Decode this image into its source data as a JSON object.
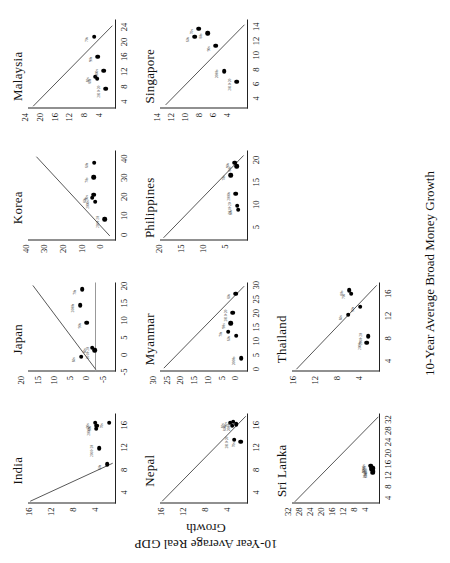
{
  "figure": {
    "xlabel": "10-Year Average Broad Money Growth",
    "ylabel": "10-Year Average Real GDP Growth"
  },
  "chart_data": {
    "type": "scatter",
    "title": "",
    "xlabel": "10-Year Average Broad Money Growth",
    "ylabel": "10-Year Average Real GDP Growth",
    "grid": false,
    "legend": "none",
    "point_labels": [
      "60s",
      "70s",
      "80s",
      "90s",
      "2000s",
      "2010-20"
    ],
    "panels": [
      {
        "name": "India",
        "xlim": [
          2,
          18
        ],
        "ylim": [
          2,
          18
        ],
        "xticks": [
          4,
          8,
          12,
          16
        ],
        "yticks": [
          4,
          8,
          12,
          16
        ],
        "trend": {
          "x1": 2.4,
          "y1": 17.6,
          "x2": 9.2,
          "y2": 2.6
        },
        "points": [
          {
            "label": "60s",
            "x": 9.0,
            "y": 3.6
          },
          {
            "label": "70s",
            "x": 16.4,
            "y": 3.2
          },
          {
            "label": "80s",
            "x": 15.9,
            "y": 5.5
          },
          {
            "label": "90s",
            "x": 16.4,
            "y": 5.8
          },
          {
            "label": "2000s",
            "x": 15.4,
            "y": 5.6
          },
          {
            "label": "2010-20",
            "x": 11.9,
            "y": 5.1
          }
        ]
      },
      {
        "name": "Japan",
        "xlim": [
          -5,
          21
        ],
        "ylim": [
          -6,
          21
        ],
        "xticks": [
          -5,
          0,
          5,
          10,
          15,
          20
        ],
        "yticks": [
          -5,
          0,
          5,
          10,
          15,
          20
        ],
        "zeroline_y": 0,
        "trend": {
          "x1": -4.4,
          "y1": 0.2,
          "x2": 20.0,
          "y2": 19.5
        },
        "points": [
          {
            "label": "60s",
            "x": -0.6,
            "y": 4.6
          },
          {
            "label": "70s",
            "x": 19.0,
            "y": 4.3
          },
          {
            "label": "80s",
            "x": 2.0,
            "y": 1.4
          },
          {
            "label": "90s",
            "x": 9.3,
            "y": 3.0
          },
          {
            "label": "2000s",
            "x": 14.4,
            "y": 5.0
          },
          {
            "label": "2010-20",
            "x": 1.3,
            "y": 0.6
          }
        ]
      },
      {
        "name": "Korea",
        "xlim": [
          -3,
          44
        ],
        "ylim": [
          -3,
          44
        ],
        "xticks": [
          0,
          10,
          20,
          30,
          40
        ],
        "yticks": [
          0,
          10,
          20,
          30,
          40
        ],
        "trend": {
          "x1": -0.6,
          "y1": 0.3,
          "x2": 41.0,
          "y2": 39.5
        },
        "points": [
          {
            "label": "60s",
            "x": 38.0,
            "y": 8.7
          },
          {
            "label": "70s",
            "x": 30.2,
            "y": 8.9
          },
          {
            "label": "80s",
            "x": 19.5,
            "y": 9.6
          },
          {
            "label": "90s",
            "x": 21.0,
            "y": 9.0
          },
          {
            "label": "2000s",
            "x": 17.4,
            "y": 8.0
          },
          {
            "label": "2010-20",
            "x": 8.2,
            "y": 3.1
          }
        ]
      },
      {
        "name": "Malaysia",
        "xlim": [
          2,
          26
        ],
        "ylim": [
          2,
          26
        ],
        "xticks": [
          4,
          8,
          12,
          16,
          20,
          24
        ],
        "yticks": [
          4,
          8,
          12,
          16,
          20,
          24
        ],
        "trend": {
          "x1": 2.6,
          "y1": 24.6,
          "x2": 24.2,
          "y2": 3.0
        },
        "points": [
          {
            "label": "60s",
            "x": 10.6,
            "y": 7.6
          },
          {
            "label": "70s",
            "x": 21.4,
            "y": 7.9
          },
          {
            "label": "80s",
            "x": 10.2,
            "y": 7.2
          },
          {
            "label": "90s",
            "x": 16.1,
            "y": 7.0
          },
          {
            "label": "2000s",
            "x": 12.3,
            "y": 5.4
          },
          {
            "label": "2010-20",
            "x": 7.4,
            "y": 4.8
          }
        ]
      },
      {
        "name": "Nepal",
        "xlim": [
          2,
          18
        ],
        "ylim": [
          2,
          18
        ],
        "xticks": [
          4,
          8,
          12,
          16
        ],
        "yticks": [
          4,
          8,
          12,
          16
        ],
        "trend": {
          "x1": 2.4,
          "y1": 17.6,
          "x2": 17.6,
          "y2": 2.4
        },
        "points": [
          {
            "label": "60s",
            "x": 16.4,
            "y": 5.2
          },
          {
            "label": "70s",
            "x": 13.0,
            "y": 3.3
          },
          {
            "label": "80s",
            "x": 15.9,
            "y": 4.9
          },
          {
            "label": "90s",
            "x": 16.6,
            "y": 4.7
          },
          {
            "label": "2000s",
            "x": 16.2,
            "y": 4.2
          },
          {
            "label": "2010-20",
            "x": 13.4,
            "y": 4.5
          }
        ]
      },
      {
        "name": "Myanmar",
        "xlim": [
          -1,
          31
        ],
        "ylim": [
          -1,
          31
        ],
        "xticks": [
          0,
          5,
          10,
          15,
          20,
          25,
          30
        ],
        "yticks": [
          0,
          5,
          10,
          15,
          20,
          25,
          30
        ],
        "trend": {
          "x1": 0.2,
          "y1": 29.6,
          "x2": 29.5,
          "y2": 0.4
        },
        "points": [
          {
            "label": "60s",
            "x": 12.0,
            "y": 3.2
          },
          {
            "label": "70s",
            "x": 13.5,
            "y": 6.2
          },
          {
            "label": "80s",
            "x": 27.0,
            "y": 3.5
          },
          {
            "label": "90s",
            "x": 16.5,
            "y": 5.3
          },
          {
            "label": "2000s",
            "x": 4.0,
            "y": 1.4
          },
          {
            "label": "2010-20",
            "x": 20.2,
            "y": 4.6
          }
        ]
      },
      {
        "name": "Philippines",
        "xlim": [
          2,
          22
        ],
        "ylim": [
          2,
          22
        ],
        "xticks": [
          5,
          10,
          15,
          20
        ],
        "yticks": [
          5,
          10,
          15,
          20
        ],
        "trend": {
          "x1": 2.6,
          "y1": 21.2,
          "x2": 21.0,
          "y2": 3.0
        },
        "points": [
          {
            "label": "60s",
            "x": 8.9,
            "y": 4.2
          },
          {
            "label": "70s",
            "x": 16.6,
            "y": 5.9
          },
          {
            "label": "80s",
            "x": 18.6,
            "y": 4.6
          },
          {
            "label": "90s",
            "x": 19.4,
            "y": 5.0
          },
          {
            "label": "2000s",
            "x": 12.5,
            "y": 4.8
          },
          {
            "label": "2010-20",
            "x": 9.8,
            "y": 4.4
          }
        ]
      },
      {
        "name": "Singapore",
        "xlim": [
          2.5,
          15
        ],
        "ylim": [
          2.5,
          15
        ],
        "xticks": [
          4,
          6,
          8,
          10,
          12,
          14
        ],
        "yticks": [
          4,
          6,
          8,
          10,
          12,
          14
        ],
        "trend": {
          "x1": 3.0,
          "y1": 14.2,
          "x2": 14.2,
          "y2": 3.0
        },
        "points": [
          {
            "label": "60s",
            "x": 12.6,
            "y": 10.1
          },
          {
            "label": "70s",
            "x": 13.7,
            "y": 9.5
          },
          {
            "label": "80s",
            "x": 13.1,
            "y": 8.2
          },
          {
            "label": "90s",
            "x": 11.3,
            "y": 7.1
          },
          {
            "label": "2000s",
            "x": 7.8,
            "y": 5.9
          },
          {
            "label": "2010-20",
            "x": 6.3,
            "y": 4.1
          }
        ]
      },
      {
        "name": "Sri Lanka",
        "xlim": [
          2,
          34
        ],
        "ylim": [
          2,
          34
        ],
        "xticks": [
          4,
          8,
          12,
          16,
          20,
          24,
          28,
          32
        ],
        "yticks": [
          4,
          8,
          12,
          16,
          20,
          24,
          28,
          32
        ],
        "trend": {
          "x1": 2.6,
          "y1": 33.0,
          "x2": 33.0,
          "y2": 2.6
        },
        "points": [
          {
            "label": "60s",
            "x": 13.0,
            "y": 4.6
          },
          {
            "label": "70s",
            "x": 13.6,
            "y": 4.4
          },
          {
            "label": "80s",
            "x": 14.6,
            "y": 4.5
          },
          {
            "label": "90s",
            "x": 14.8,
            "y": 5.1
          },
          {
            "label": "2000s",
            "x": 15.5,
            "y": 5.4
          },
          {
            "label": "2010-20",
            "x": 14.2,
            "y": 5.0
          }
        ]
      },
      {
        "name": "Thailand",
        "xlim": [
          2,
          18
        ],
        "ylim": [
          2,
          18
        ],
        "xticks": [
          4,
          8,
          12,
          16
        ],
        "yticks": [
          4,
          8,
          12,
          16
        ],
        "trend": {
          "x1": 2.4,
          "y1": 17.2,
          "x2": 17.4,
          "y2": 2.6
        },
        "points": [
          {
            "label": "60s",
            "x": 12.2,
            "y": 7.8
          },
          {
            "label": "70s",
            "x": 16.0,
            "y": 7.2
          },
          {
            "label": "80s",
            "x": 16.6,
            "y": 7.6
          },
          {
            "label": "90s",
            "x": 13.7,
            "y": 5.6
          },
          {
            "label": "2000s",
            "x": 7.2,
            "y": 4.4
          },
          {
            "label": "2010-20",
            "x": 8.4,
            "y": 4.2
          }
        ]
      }
    ],
    "layout": {
      "rows": 3,
      "cols": 4,
      "order": [
        "India",
        "Japan",
        "Korea",
        "Malaysia",
        "Nepal",
        "Myanmar",
        "Philippines",
        "Singapore",
        "Sri Lanka",
        "Thailand",
        "",
        ""
      ]
    }
  }
}
